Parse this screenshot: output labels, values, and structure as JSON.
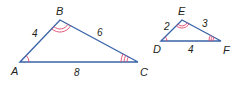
{
  "diagram": {
    "type": "similar-triangles",
    "colors": {
      "edge": "#3a64a8",
      "angle_mark": "#e0466a",
      "text": "#231f20",
      "background": "#ffffff"
    },
    "triangles": [
      {
        "name": "ABC",
        "vertices": {
          "A": "A",
          "B": "B",
          "C": "C"
        },
        "sides": {
          "AB": "4",
          "BC": "6",
          "AC": "8"
        },
        "angle_marks": {
          "A": 1,
          "B": 2,
          "C": 3
        }
      },
      {
        "name": "DEF",
        "vertices": {
          "D": "D",
          "E": "E",
          "F": "F"
        },
        "sides": {
          "DE": "2",
          "EF": "3",
          "DF": "4"
        },
        "angle_marks": {
          "D": 1,
          "E": 2,
          "F": 3
        }
      }
    ]
  }
}
